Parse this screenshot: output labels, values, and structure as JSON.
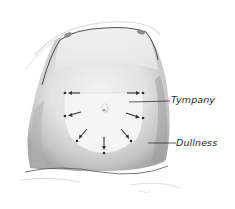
{
  "figure": {
    "labels": {
      "tympany": "Tympany",
      "dullness": "Dullness"
    },
    "colors": {
      "background": "#ffffff",
      "skin_shadow": "#bdbdbd",
      "skin_mid": "#d9d9d9",
      "tympany_zone": "#f4f4f4",
      "outline": "#3a3a3a",
      "arrow": "#333333"
    },
    "markers": {
      "dot_count": 7,
      "arrow_count": 7
    }
  }
}
